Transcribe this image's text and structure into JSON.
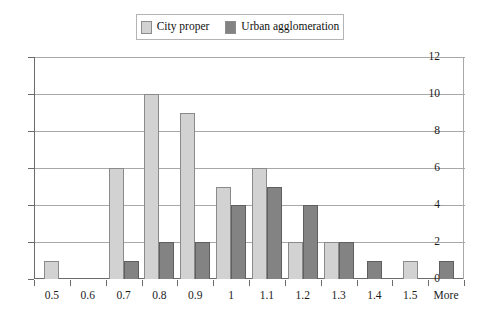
{
  "chart_data": {
    "type": "bar",
    "title": "",
    "subtitle": "",
    "xlabel": "",
    "ylabel": "",
    "ylim": [
      0,
      12
    ],
    "ytick_step": 2,
    "yticks": [
      "0",
      "2",
      "4",
      "6",
      "8",
      "10",
      "12"
    ],
    "grid": true,
    "legend_position": "top-center",
    "categories": [
      "0.5",
      "0.6",
      "0.7",
      "0.8",
      "0.9",
      "1",
      "1.1",
      "1.2",
      "1.3",
      "1.4",
      "1.5",
      "More"
    ],
    "series": [
      {
        "name": "City proper",
        "color": "#d2d2d2",
        "values": [
          1,
          0,
          6,
          10,
          9,
          5,
          6,
          2,
          2,
          0,
          1,
          0
        ]
      },
      {
        "name": "Urban agglomeration",
        "color": "#838383",
        "values": [
          0,
          0,
          1,
          2,
          2,
          4,
          5,
          4,
          2,
          1,
          0,
          1
        ]
      }
    ]
  },
  "legend": {
    "entries": [
      {
        "label": "City proper",
        "swatch_name": "legend-swatch-city-proper"
      },
      {
        "label": "Urban agglomeration",
        "swatch_name": "legend-swatch-urban-agglomeration"
      }
    ]
  }
}
